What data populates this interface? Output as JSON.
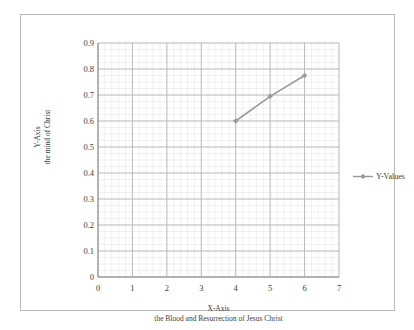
{
  "chart_data": {
    "type": "line",
    "title": "",
    "xlabel": "X-Axis",
    "xlabel_sub": "the Blood and Resurrection of Jesus Christ",
    "ylabel": "Y-Axis",
    "ylabel_sub": "the mind of Christ",
    "xlim": [
      0,
      7
    ],
    "ylim": [
      0,
      0.9
    ],
    "xticks": [
      "0",
      "1",
      "2",
      "3",
      "4",
      "5",
      "6",
      "7"
    ],
    "yticks": [
      "0",
      "0.1",
      "0.2",
      "0.3",
      "0.4",
      "0.5",
      "0.6",
      "0.7",
      "0.8",
      "0.9"
    ],
    "xtick_values": [
      0,
      1,
      2,
      3,
      4,
      5,
      6,
      7
    ],
    "ytick_values": [
      0,
      0.1,
      0.2,
      0.3,
      0.4,
      0.5,
      0.6,
      0.7,
      0.8,
      0.9
    ],
    "grid": true,
    "minor_grid": true,
    "minor_grid_x_step": 0.2,
    "minor_grid_y_step": 0.025,
    "legend_position": "right",
    "series": [
      {
        "name": "Y-Values",
        "x": [
          4,
          5,
          6
        ],
        "values": [
          0.6,
          0.695,
          0.775
        ],
        "color": "#9a9a9a",
        "marker": "diamond"
      }
    ]
  },
  "legend": {
    "entries": [
      {
        "label": "Y-Values",
        "color": "#9a9a9a"
      }
    ]
  },
  "colors": {
    "series": "#9a9a9a",
    "major_grid": "#b0b0b0",
    "minor_grid": "#e2e2e2",
    "axis": "#8a8a8a",
    "frame": "#b9b9b9",
    "text": "#3d3d3d"
  }
}
